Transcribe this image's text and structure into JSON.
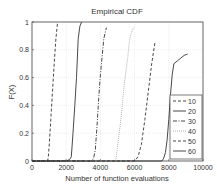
{
  "chart_data": {
    "type": "line",
    "title": "Empirical CDF",
    "xlabel": "Number of function evaluations",
    "ylabel": "F(X)",
    "xlim": [
      0,
      10000
    ],
    "ylim": [
      0,
      1
    ],
    "xticks": [
      0,
      2000,
      4000,
      6000,
      8000,
      10000
    ],
    "yticks": [
      0,
      0.2,
      0.4,
      0.6,
      0.8,
      1
    ],
    "xtick_labels": [
      "0",
      "2000",
      "4000",
      "6000",
      "8000",
      "10000"
    ],
    "ytick_labels": [
      "0",
      "0.2",
      "0.4",
      "0.6",
      "0.8",
      "1"
    ],
    "grid": true,
    "legend_position": "lower right",
    "series": [
      {
        "name": "10",
        "style": "dashed",
        "x": [
          0,
          900,
          950,
          1000,
          1100,
          1200,
          1300,
          1400,
          1500
        ],
        "y": [
          0,
          0,
          0.02,
          0.1,
          0.3,
          0.5,
          0.7,
          0.88,
          1.0
        ]
      },
      {
        "name": "20",
        "style": "solid",
        "x": [
          0,
          2000,
          2200,
          2300,
          2400,
          2500,
          2600,
          2700,
          2800,
          2900
        ],
        "y": [
          0,
          0,
          0.01,
          0.03,
          0.2,
          0.4,
          0.6,
          0.88,
          0.97,
          1.0
        ]
      },
      {
        "name": "30",
        "style": "dashdot",
        "x": [
          0,
          3500,
          3600,
          3700,
          3800,
          3900,
          4000,
          4100,
          4200,
          4350
        ],
        "y": [
          0,
          0,
          0.02,
          0.08,
          0.25,
          0.45,
          0.62,
          0.75,
          0.88,
          0.96
        ]
      },
      {
        "name": "40",
        "style": "dotted",
        "x": [
          0,
          4900,
          5000,
          5200,
          5400,
          5600,
          5700,
          5800,
          5950
        ],
        "y": [
          0,
          0,
          0.1,
          0.3,
          0.55,
          0.75,
          0.87,
          0.92,
          0.96
        ]
      },
      {
        "name": "50",
        "style": "dashed",
        "x": [
          0,
          6000,
          6200,
          6400,
          6600,
          6800,
          7000,
          7200
        ],
        "y": [
          0,
          0,
          0.03,
          0.12,
          0.3,
          0.5,
          0.7,
          0.86
        ]
      },
      {
        "name": "60",
        "style": "solid",
        "x": [
          0,
          7600,
          7700,
          7800,
          7900,
          8000,
          8100,
          8200,
          8300,
          8500,
          8700,
          8900,
          9100
        ],
        "y": [
          0,
          0,
          0.02,
          0.06,
          0.15,
          0.3,
          0.48,
          0.62,
          0.7,
          0.72,
          0.74,
          0.76,
          0.77
        ]
      }
    ]
  },
  "colors": {
    "line": "#333333",
    "light_line": "#aaaaaa",
    "grid": "#e2e2e2",
    "axis": "#444444"
  }
}
